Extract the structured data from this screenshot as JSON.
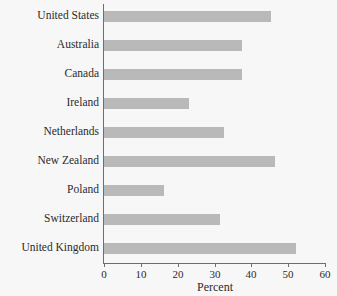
{
  "chart_data": {
    "type": "bar",
    "orientation": "horizontal",
    "title": "",
    "xlabel": "Percent",
    "ylabel": "",
    "xlim": [
      0,
      60
    ],
    "xticks": [
      0,
      10,
      20,
      30,
      40,
      50,
      60
    ],
    "grid": false,
    "legend": false,
    "bar_color": "#b9b9b9",
    "background_color": "#f7f7f7",
    "axis_color": "#6e6e6e",
    "text_color": "#2b2b2b",
    "categories": [
      "United States",
      "Australia",
      "Canada",
      "Ireland",
      "Netherlands",
      "New Zealand",
      "Poland",
      "Switzerland",
      "United Kingdom"
    ],
    "values": [
      45.4,
      37.6,
      37.5,
      23.2,
      32.7,
      46.5,
      16.3,
      31.4,
      52.0
    ]
  }
}
